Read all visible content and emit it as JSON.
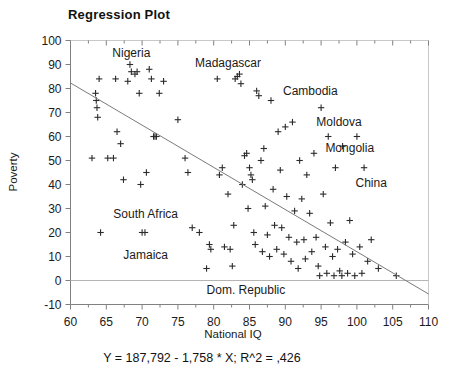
{
  "title": "Regression Plot",
  "equation": "Y = 187,792 - 1,758 * X; R^2 = ,426",
  "axes": {
    "x_label": "National IQ",
    "y_label": "Poverty",
    "x_ticks": [
      "60",
      "65",
      "70",
      "75",
      "80",
      "85",
      "90",
      "95",
      "100",
      "105",
      "110"
    ],
    "y_ticks": [
      "100",
      "90",
      "80",
      "70",
      "60",
      "50",
      "40",
      "30",
      "20",
      "10",
      "0",
      "-10"
    ]
  },
  "chart_data": {
    "type": "scatter",
    "title": "Regression Plot",
    "xlabel": "National IQ",
    "ylabel": "Poverty",
    "xlim": [
      60,
      110
    ],
    "ylim": [
      -10,
      100
    ],
    "x_major_step": 5,
    "y_major_step": 10,
    "grid": false,
    "legend": null,
    "reference_lines": [
      {
        "name": "zero-line",
        "orientation": "horizontal",
        "y": 0
      }
    ],
    "fit": {
      "type": "linear",
      "equation_text": "Y = 187,792 - 1,758 * X; R^2 = ,426",
      "intercept": 187.792,
      "slope": -1.758,
      "r_squared": 0.426,
      "x_start": 60,
      "y_start": 82.3,
      "x_end": 110,
      "y_end": -5.6
    },
    "marker": "plus",
    "points": [
      [
        63.0,
        51.0
      ],
      [
        63.5,
        78.0
      ],
      [
        63.6,
        75.0
      ],
      [
        63.7,
        72.0
      ],
      [
        63.8,
        68.0
      ],
      [
        64.0,
        84.0
      ],
      [
        64.2,
        20.0
      ],
      [
        65.2,
        51.0
      ],
      [
        66.0,
        51.0
      ],
      [
        66.3,
        84.0
      ],
      [
        66.5,
        62.0
      ],
      [
        67.0,
        57.0
      ],
      [
        67.4,
        42.0
      ],
      [
        68.0,
        83.0
      ],
      [
        68.3,
        90.0
      ],
      [
        68.5,
        87.0
      ],
      [
        69.0,
        86.0
      ],
      [
        69.3,
        87.0
      ],
      [
        69.6,
        78.0
      ],
      [
        69.8,
        40.0
      ],
      [
        70.0,
        20.0
      ],
      [
        70.4,
        20.0
      ],
      [
        70.6,
        45.0
      ],
      [
        71.0,
        88.0
      ],
      [
        71.3,
        84.0
      ],
      [
        71.6,
        60.0
      ],
      [
        71.8,
        60.0
      ],
      [
        72.0,
        60.0
      ],
      [
        72.4,
        78.0
      ],
      [
        73.0,
        83.0
      ],
      [
        75.0,
        67.0
      ],
      [
        76.0,
        51.0
      ],
      [
        76.4,
        45.0
      ],
      [
        77.0,
        22.0
      ],
      [
        78.0,
        20.0
      ],
      [
        79.0,
        5.0
      ],
      [
        79.4,
        15.0
      ],
      [
        79.6,
        13.0
      ],
      [
        80.5,
        84.0
      ],
      [
        80.8,
        44.0
      ],
      [
        81.2,
        47.0
      ],
      [
        81.5,
        14.0
      ],
      [
        82.0,
        36.0
      ],
      [
        82.3,
        13.0
      ],
      [
        82.6,
        6.0
      ],
      [
        82.8,
        23.0
      ],
      [
        83.0,
        84.0
      ],
      [
        83.3,
        85.0
      ],
      [
        83.6,
        86.0
      ],
      [
        83.8,
        82.0
      ],
      [
        84.0,
        40.0
      ],
      [
        84.3,
        52.0
      ],
      [
        84.6,
        53.0
      ],
      [
        84.8,
        30.0
      ],
      [
        85.0,
        47.0
      ],
      [
        85.2,
        44.0
      ],
      [
        85.4,
        42.0
      ],
      [
        85.6,
        20.0
      ],
      [
        85.8,
        15.0
      ],
      [
        86.0,
        79.0
      ],
      [
        86.3,
        77.0
      ],
      [
        86.6,
        50.0
      ],
      [
        86.8,
        12.0
      ],
      [
        87.0,
        55.0
      ],
      [
        87.2,
        31.0
      ],
      [
        87.5,
        19.0
      ],
      [
        87.8,
        10.0
      ],
      [
        88.0,
        75.0
      ],
      [
        88.3,
        38.0
      ],
      [
        88.5,
        23.0
      ],
      [
        88.8,
        13.0
      ],
      [
        89.0,
        62.0
      ],
      [
        89.3,
        46.0
      ],
      [
        89.5,
        22.0
      ],
      [
        89.8,
        11.0
      ],
      [
        90.0,
        64.0
      ],
      [
        90.2,
        35.0
      ],
      [
        90.5,
        18.0
      ],
      [
        90.8,
        8.0
      ],
      [
        91.0,
        66.0
      ],
      [
        91.3,
        29.0
      ],
      [
        91.6,
        16.0
      ],
      [
        91.8,
        5.0
      ],
      [
        92.0,
        50.0
      ],
      [
        92.3,
        34.0
      ],
      [
        92.6,
        17.0
      ],
      [
        92.8,
        9.0
      ],
      [
        93.0,
        44.0
      ],
      [
        93.4,
        28.0
      ],
      [
        93.7,
        12.0
      ],
      [
        94.0,
        53.0
      ],
      [
        94.3,
        18.0
      ],
      [
        94.6,
        6.0
      ],
      [
        94.8,
        2.0
      ],
      [
        95.0,
        72.0
      ],
      [
        95.3,
        36.0
      ],
      [
        95.6,
        14.0
      ],
      [
        95.8,
        3.0
      ],
      [
        96.0,
        60.0
      ],
      [
        96.3,
        24.0
      ],
      [
        96.6,
        10.0
      ],
      [
        96.8,
        2.0
      ],
      [
        97.0,
        47.0
      ],
      [
        97.3,
        13.0
      ],
      [
        97.6,
        4.0
      ],
      [
        97.9,
        2.0
      ],
      [
        98.0,
        56.0
      ],
      [
        98.4,
        16.0
      ],
      [
        98.7,
        3.0
      ],
      [
        99.0,
        25.0
      ],
      [
        99.4,
        11.0
      ],
      [
        99.7,
        2.0
      ],
      [
        100.0,
        60.0
      ],
      [
        100.4,
        14.0
      ],
      [
        100.7,
        3.0
      ],
      [
        101.0,
        47.0
      ],
      [
        101.5,
        8.0
      ],
      [
        102.0,
        17.0
      ],
      [
        103.0,
        5.0
      ],
      [
        105.5,
        2.0
      ]
    ],
    "annotations": [
      {
        "text": "Nigeria",
        "x": 68.5,
        "y": 93.0
      },
      {
        "text": "Madagascar",
        "x": 82.0,
        "y": 89.0
      },
      {
        "text": "Cambodia",
        "x": 93.5,
        "y": 77.5
      },
      {
        "text": "Moldova",
        "x": 97.5,
        "y": 64.5
      },
      {
        "text": "Mongolia",
        "x": 99.0,
        "y": 53.5
      },
      {
        "text": "China",
        "x": 102.0,
        "y": 39.0
      },
      {
        "text": "South Africa",
        "x": 70.5,
        "y": 26.0
      },
      {
        "text": "Jamaica",
        "x": 70.5,
        "y": 9.0
      },
      {
        "text": "Dom. Republic",
        "x": 84.5,
        "y": -5.5
      }
    ]
  }
}
